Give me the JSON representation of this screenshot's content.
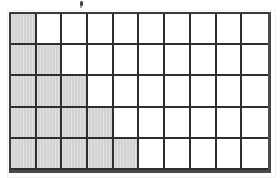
{
  "figure": {
    "kind": "shaded-grid",
    "artifact_label": ""
  },
  "chart_data": {
    "type": "heatmap",
    "title": "",
    "subtitle": "",
    "xlabel": "",
    "ylabel": "",
    "columns": 10,
    "rows": 6,
    "legend_position": "none",
    "grid": true,
    "categories": [
      "1",
      "2",
      "3",
      "4",
      "5",
      "6",
      "7",
      "8",
      "9",
      "10"
    ],
    "row_labels": [
      "1",
      "2",
      "3",
      "4",
      "5",
      "6"
    ],
    "shaded_counts_per_row": [
      1,
      2,
      3,
      4,
      5,
      6
    ],
    "total_cells": 60,
    "total_shaded": 21,
    "total_unshaded": 39,
    "colors": {
      "shaded": "#d2d2d2",
      "unshaded": "#ffffff",
      "gridline": "#2e2e2e",
      "outer_border": "#4a4a4a",
      "background": "#ffffff"
    },
    "cells": [
      [
        1,
        0,
        0,
        0,
        0,
        0,
        0,
        0,
        0,
        0
      ],
      [
        1,
        1,
        0,
        0,
        0,
        0,
        0,
        0,
        0,
        0
      ],
      [
        1,
        1,
        1,
        0,
        0,
        0,
        0,
        0,
        0,
        0
      ],
      [
        1,
        1,
        1,
        1,
        0,
        0,
        0,
        0,
        0,
        0
      ],
      [
        1,
        1,
        1,
        1,
        1,
        0,
        0,
        0,
        0,
        0
      ],
      [
        1,
        1,
        1,
        1,
        1,
        1,
        0,
        0,
        0,
        0
      ]
    ]
  }
}
